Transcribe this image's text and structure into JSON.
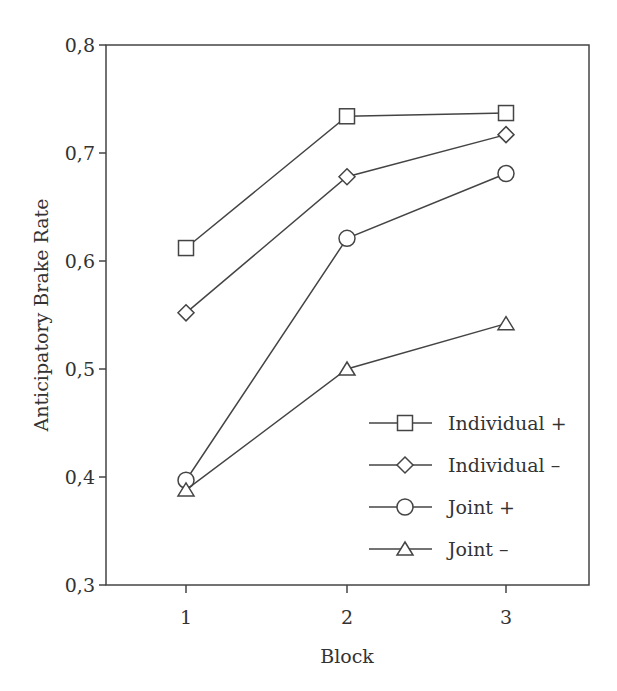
{
  "chart_data": {
    "type": "line",
    "title": "",
    "xlabel": "Block",
    "ylabel": "Anticipatory Brake Rate",
    "x": [
      1,
      2,
      3
    ],
    "x_tick_labels": [
      "1",
      "2",
      "3"
    ],
    "y_ticks": [
      0.3,
      0.4,
      0.5,
      0.6,
      0.7,
      0.8
    ],
    "y_tick_labels": [
      "0,3",
      "0,4",
      "0,5",
      "0,6",
      "0,7",
      "0,8"
    ],
    "ylim": [
      0.3,
      0.8
    ],
    "grid": false,
    "legend_position": "lower right (inside plot)",
    "series": [
      {
        "name": "Individual +",
        "marker": "square",
        "values": [
          0.612,
          0.734,
          0.737
        ]
      },
      {
        "name": "Individual –",
        "marker": "diamond",
        "values": [
          0.552,
          0.678,
          0.717
        ]
      },
      {
        "name": "Joint +",
        "marker": "circle",
        "values": [
          0.397,
          0.621,
          0.681
        ]
      },
      {
        "name": "Joint –",
        "marker": "triangle",
        "values": [
          0.388,
          0.5,
          0.542
        ]
      }
    ]
  },
  "colors": {
    "line": "#444444",
    "axis": "#444444",
    "text": "#333333"
  }
}
